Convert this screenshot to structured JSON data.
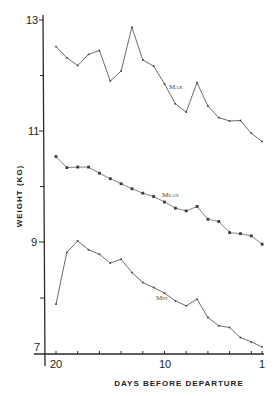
{
  "chart_data": {
    "type": "line",
    "title": "",
    "xlabel": "DAYS BEFORE DEPARTURE",
    "ylabel": "WEIGHT (KG)",
    "xlim": [
      20,
      1
    ],
    "ylim": [
      7,
      13
    ],
    "grid": false,
    "legend_position": "inline labels",
    "x": [
      20,
      19,
      18,
      17,
      16,
      15,
      14,
      13,
      12,
      11,
      10,
      9,
      8,
      7,
      6,
      5,
      4,
      3,
      2,
      1
    ],
    "xticks": [
      20,
      18,
      16,
      14,
      12,
      10,
      8,
      6,
      4,
      2,
      1
    ],
    "xtick_labels": [
      "20",
      "10",
      "1"
    ],
    "yticks": [
      13,
      12,
      11,
      10,
      9,
      8,
      7
    ],
    "ytick_labels": [
      "13",
      "11",
      "9",
      "7"
    ],
    "series": [
      {
        "name": "Max",
        "values": [
          12.52,
          12.32,
          12.18,
          12.38,
          12.45,
          11.9,
          12.08,
          12.87,
          12.28,
          12.17,
          11.85,
          11.49,
          11.34,
          11.87,
          11.45,
          11.24,
          11.18,
          11.19,
          10.96,
          10.81
        ]
      },
      {
        "name": "Mean",
        "values": [
          10.54,
          10.34,
          10.35,
          10.35,
          10.24,
          10.14,
          10.05,
          9.96,
          9.88,
          9.82,
          9.72,
          9.61,
          9.56,
          9.64,
          9.41,
          9.37,
          9.17,
          9.15,
          9.11,
          8.96
        ]
      },
      {
        "name": "Min",
        "values": [
          7.88,
          8.81,
          9.02,
          8.86,
          8.78,
          8.62,
          8.69,
          8.45,
          8.27,
          8.18,
          8.08,
          7.94,
          7.85,
          7.97,
          7.64,
          7.49,
          7.46,
          7.28,
          7.2,
          7.11
        ]
      }
    ]
  }
}
